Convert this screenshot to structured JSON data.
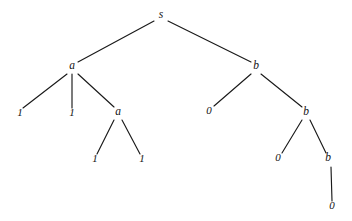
{
  "figure": {
    "kind": "parse-tree",
    "background_color": "#ffffff",
    "ink_color": "#141414",
    "edge_color": "#1a1a1a",
    "width": 352,
    "height": 221
  },
  "tree": {
    "root_symbol": "s",
    "nodes": [
      {
        "id": "n0",
        "label": "s",
        "role": "root",
        "x": 161,
        "y": 18,
        "label_x": 161,
        "label_y": 18
      },
      {
        "id": "n1",
        "label": "a",
        "role": "internal",
        "x": 72,
        "y": 69,
        "label_x": 72,
        "label_y": 69
      },
      {
        "id": "n2",
        "label": "b",
        "role": "internal",
        "x": 256,
        "y": 69,
        "label_x": 256,
        "label_y": 69
      },
      {
        "id": "n3",
        "label": "1",
        "role": "leaf",
        "x": 20,
        "y": 116,
        "label_x": 20,
        "label_y": 116
      },
      {
        "id": "n4",
        "label": "1",
        "role": "leaf",
        "x": 72,
        "y": 116,
        "label_x": 72,
        "label_y": 116
      },
      {
        "id": "n5",
        "label": "a",
        "role": "internal",
        "x": 118,
        "y": 115,
        "label_x": 118,
        "label_y": 115
      },
      {
        "id": "n6",
        "label": "0",
        "role": "leaf",
        "x": 209,
        "y": 114,
        "label_x": 209,
        "label_y": 114
      },
      {
        "id": "n7",
        "label": "b",
        "role": "internal",
        "x": 306,
        "y": 115,
        "label_x": 306,
        "label_y": 115
      },
      {
        "id": "n8",
        "label": "1",
        "role": "leaf",
        "x": 95,
        "y": 162,
        "label_x": 95,
        "label_y": 162
      },
      {
        "id": "n9",
        "label": "1",
        "role": "leaf",
        "x": 142,
        "y": 162,
        "label_x": 142,
        "label_y": 162
      },
      {
        "id": "n10",
        "label": "0",
        "role": "leaf",
        "x": 278,
        "y": 161,
        "label_x": 278,
        "label_y": 161
      },
      {
        "id": "n11",
        "label": "b",
        "role": "internal",
        "x": 328,
        "y": 161,
        "label_x": 328,
        "label_y": 161
      },
      {
        "id": "n12",
        "label": "0",
        "role": "leaf",
        "x": 332,
        "y": 209,
        "label_x": 332,
        "label_y": 209
      }
    ],
    "edges": [
      {
        "from": "n0",
        "to": "n1",
        "x1": 154,
        "y1": 21,
        "x2": 78,
        "y2": 62
      },
      {
        "from": "n0",
        "to": "n2",
        "x1": 168,
        "y1": 21,
        "x2": 251,
        "y2": 62
      },
      {
        "from": "n1",
        "to": "n3",
        "x1": 67,
        "y1": 74,
        "x2": 23,
        "y2": 108
      },
      {
        "from": "n1",
        "to": "n4",
        "x1": 72,
        "y1": 74,
        "x2": 72,
        "y2": 108
      },
      {
        "from": "n1",
        "to": "n5",
        "x1": 78,
        "y1": 74,
        "x2": 114,
        "y2": 107
      },
      {
        "from": "n2",
        "to": "n6",
        "x1": 251,
        "y1": 74,
        "x2": 214,
        "y2": 106
      },
      {
        "from": "n2",
        "to": "n7",
        "x1": 261,
        "y1": 74,
        "x2": 302,
        "y2": 107
      },
      {
        "from": "n5",
        "to": "n8",
        "x1": 114,
        "y1": 120,
        "x2": 97,
        "y2": 154
      },
      {
        "from": "n5",
        "to": "n9",
        "x1": 122,
        "y1": 120,
        "x2": 140,
        "y2": 154
      },
      {
        "from": "n7",
        "to": "n10",
        "x1": 302,
        "y1": 120,
        "x2": 282,
        "y2": 153
      },
      {
        "from": "n7",
        "to": "n11",
        "x1": 310,
        "y1": 120,
        "x2": 326,
        "y2": 153
      },
      {
        "from": "n11",
        "to": "n12",
        "x1": 331,
        "y1": 167,
        "x2": 332,
        "y2": 201
      }
    ],
    "yield": [
      "1",
      "1",
      "1",
      "1",
      "0",
      "0",
      "0",
      "0"
    ],
    "yield_string": "11110000"
  }
}
